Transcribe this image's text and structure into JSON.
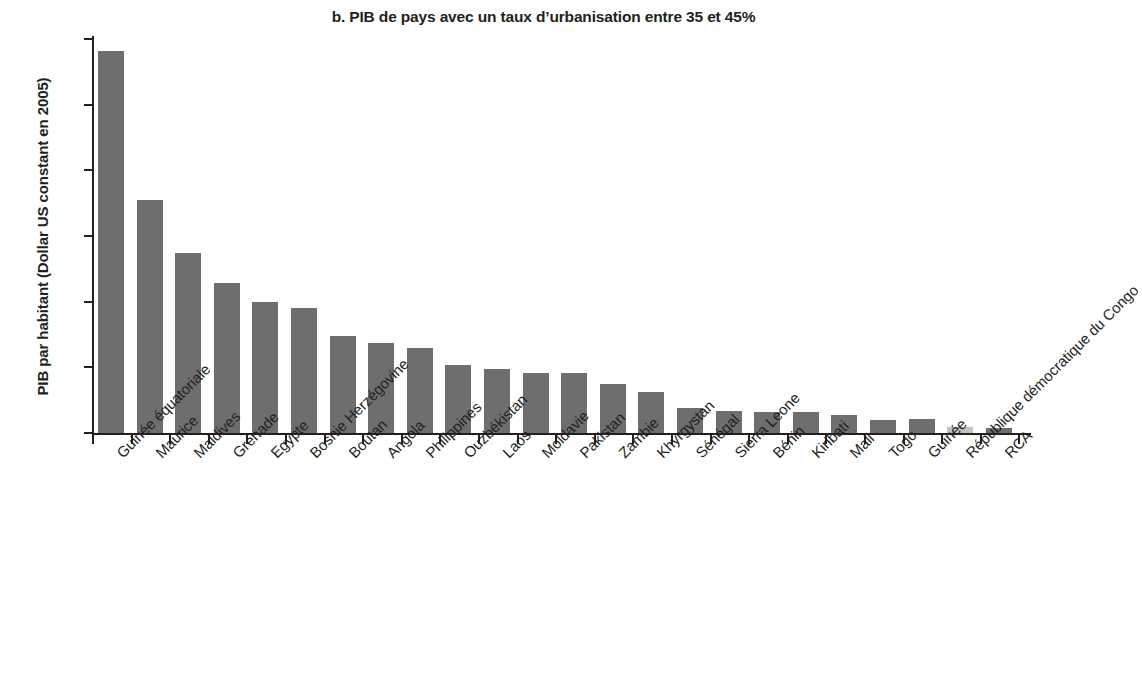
{
  "chart_data": {
    "type": "bar",
    "title": "b. PIB de pays avec un taux d’urbanisation entre 35 et 45%",
    "xlabel": "",
    "ylabel": "PIB par habitant (Dollar US constant en 2005)",
    "ylim": [
      0,
      30000
    ],
    "yticks": [
      0,
      5000,
      10000,
      15000,
      20000,
      25000,
      30000
    ],
    "ytick_labels": [
      "0",
      "5 000",
      "10 000",
      "15 000",
      "20 000",
      "25 000",
      "30 000"
    ],
    "grid": false,
    "legend": null,
    "bar_color": "#6f6e6e",
    "highlight_color": "#c3c3c3",
    "highlight_category": "République démocratique du Congo",
    "categories": [
      "Guinée équatoriale",
      "Maurice",
      "Maldives",
      "Grenade",
      "Egypte",
      "Bosnie Herzégovine",
      "Boutan",
      "Angola",
      "Philippines",
      "Ouzbékistan",
      "Laos",
      "Moldavie",
      "Pakistan",
      "Zambie",
      "Khyrgystan",
      "Sénégal",
      "Sierra Leone",
      "Bénin",
      "Kiribati",
      "Mali",
      "Togo",
      "Guinée",
      "République démocratique du Congo",
      "RCA"
    ],
    "values": [
      29100,
      17750,
      13700,
      11450,
      10000,
      9500,
      7400,
      6850,
      6500,
      5150,
      4900,
      4600,
      4550,
      3700,
      3100,
      1900,
      1650,
      1600,
      1600,
      1350,
      1000,
      1050,
      450,
      400
    ]
  }
}
